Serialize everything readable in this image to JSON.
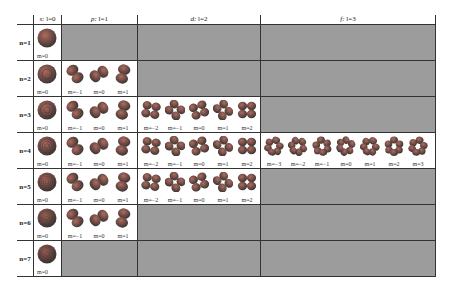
{
  "columns": [
    {
      "key": "s",
      "symbol": "s:",
      "label": "l=0",
      "width": 28,
      "slots": 1
    },
    {
      "key": "p",
      "symbol": "p:",
      "label": "l=1",
      "width": 76,
      "slots": 3
    },
    {
      "key": "d",
      "symbol": "d:",
      "label": "l=2",
      "width": 123,
      "slots": 5
    },
    {
      "key": "f",
      "symbol": "f:",
      "label": "l=3",
      "width": 175,
      "slots": 7
    }
  ],
  "rows": [
    {
      "label": "n=1",
      "cells": {
        "s": [
          "m=0"
        ],
        "p": null,
        "d": null,
        "f": null
      }
    },
    {
      "label": "n=2",
      "cells": {
        "s": [
          "m=0"
        ],
        "p": [
          "m=−1",
          "m=0",
          "m=1"
        ],
        "d": null,
        "f": null
      }
    },
    {
      "label": "n=3",
      "cells": {
        "s": [
          "m=0"
        ],
        "p": [
          "m=−1",
          "m=0",
          "m=1"
        ],
        "d": [
          "m=−2",
          "m=−1",
          "m=0",
          "m=1",
          "m=2"
        ],
        "f": null
      }
    },
    {
      "label": "n=4",
      "cells": {
        "s": [
          "m=0"
        ],
        "p": [
          "m=−1",
          "m=0",
          "m=1"
        ],
        "d": [
          "m=−2",
          "m=−1",
          "m=0",
          "m=1",
          "m=2"
        ],
        "f": [
          "m=−3",
          "m=−2",
          "m=−1",
          "m=0",
          "m=1",
          "m=2",
          "m=3"
        ]
      }
    },
    {
      "label": "n=5",
      "cells": {
        "s": [
          "m=0"
        ],
        "p": [
          "m=−1",
          "m=0",
          "m=1"
        ],
        "d": [
          "m=−2",
          "m=−1",
          "m=0",
          "m=1",
          "m=2"
        ],
        "f": null
      }
    },
    {
      "label": "n=6",
      "cells": {
        "s": [
          "m=0"
        ],
        "p": [
          "m=−1",
          "m=0",
          "m=1"
        ],
        "d": null,
        "f": null
      }
    },
    {
      "label": "n=7",
      "cells": {
        "s": [
          "m=0"
        ],
        "p": null,
        "d": null,
        "f": null
      }
    }
  ],
  "colors": {
    "empty_fill": "#9c9c9c",
    "orbital_light": "#b06a5e",
    "orbital_dark": "#3e3634",
    "grid_line": "#333333"
  }
}
